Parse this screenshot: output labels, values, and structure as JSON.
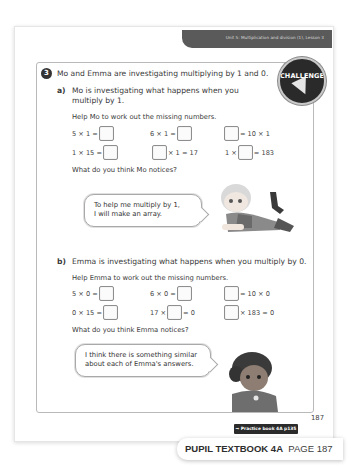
{
  "header": {
    "unit_label": "Unit 5: Multiplication and division (1), Lesson 3"
  },
  "badge": {
    "label": "CHALLENGE",
    "icon": "lightning-bolt-icon"
  },
  "question": {
    "number": "3",
    "intro": "Mo and Emma are investigating multiplying by 1 and 0.",
    "part_a": {
      "letter": "a)",
      "line1": "Mo is investigating what happens when you",
      "line2": "multiply by 1.",
      "instruction": "Help Mo to work out the missing numbers.",
      "equations": [
        {
          "left": "5 × 1 =",
          "right": ""
        },
        {
          "left": "6 × 1 =",
          "right": ""
        },
        {
          "left": "",
          "right": "= 10 × 1"
        },
        {
          "left": "1 × 15 =",
          "right": ""
        },
        {
          "left": "",
          "right": "× 1 = 17"
        },
        {
          "left": "1 ×",
          "right": "= 183"
        }
      ],
      "prompt": "What do you think Mo notices?",
      "speech": {
        "line1": "To help me multiply by 1,",
        "line2": "I will make an array."
      }
    },
    "part_b": {
      "letter": "b)",
      "line1": "Emma is investigating what happens when you multiply by 0.",
      "instruction": "Help Emma to work out the missing numbers.",
      "equations": [
        {
          "left": "5 × 0 =",
          "right": ""
        },
        {
          "left": "6 × 0 =",
          "right": ""
        },
        {
          "left": "",
          "right": "= 10 × 0"
        },
        {
          "left": "0 × 15 =",
          "right": ""
        },
        {
          "left": "17 ×",
          "right": "= 0"
        },
        {
          "left": "",
          "right": "× 183 = 0"
        }
      ],
      "prompt": "What do you think Emma notices?",
      "speech": {
        "line1": "I think there is something similar",
        "line2": "about each of Emma's answers."
      }
    }
  },
  "footer": {
    "page_number": "187",
    "practice_ref": "→ Practice book 4A p135",
    "tab_title": "PUPIL TEXTBOOK 4A",
    "tab_page": "PAGE 187"
  }
}
